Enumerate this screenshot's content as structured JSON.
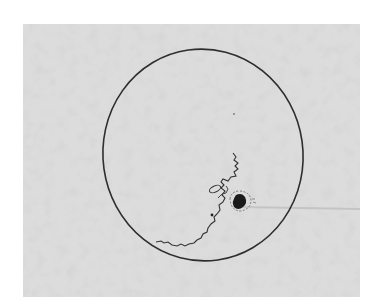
{
  "image": {
    "subject": "hand-drawn sunspot sketch of solar disk",
    "background_color": "#ffffff",
    "paper_color": "#dcdcdc",
    "ink_color": "#2a2a2a"
  }
}
